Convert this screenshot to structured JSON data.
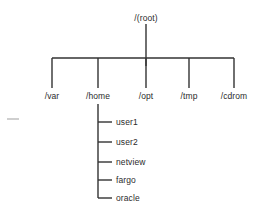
{
  "diagram": {
    "type": "filesystem-tree",
    "title": "/(root)",
    "canvas": {
      "width": 258,
      "height": 211,
      "background": "#ffffff"
    },
    "line_color": "#333333",
    "text_color": "#2b2b2b",
    "root": {
      "label": "/(root)",
      "label_x": 146,
      "label_y": 13,
      "stem_x": 146,
      "stem_top": 24,
      "stem_bottom": 66
    },
    "bus": {
      "y": 58,
      "x_start": 52,
      "x_end": 234
    },
    "children": [
      {
        "label": "/var",
        "x": 52,
        "label_y": 91,
        "branch_top": 58,
        "branch_bottom": 88
      },
      {
        "label": "/home",
        "x": 98,
        "label_y": 91,
        "branch_top": 58,
        "branch_bottom": 88
      },
      {
        "label": "/opt",
        "x": 146,
        "label_y": 91,
        "branch_top": 58,
        "branch_bottom": 88
      },
      {
        "label": "/tmp",
        "x": 189,
        "label_y": 91,
        "branch_top": 58,
        "branch_bottom": 88
      },
      {
        "label": "/cdrom",
        "x": 234,
        "label_y": 91,
        "branch_top": 58,
        "branch_bottom": 88
      }
    ],
    "home_subtree": {
      "parent": "/home",
      "spine_x": 98,
      "spine_top": 104,
      "spine_bottom": 198,
      "stub_end_x": 112,
      "label_x": 116,
      "items": [
        {
          "label": "user1",
          "y": 122
        },
        {
          "label": "user2",
          "y": 142
        },
        {
          "label": "netview",
          "y": 162
        },
        {
          "label": "fargo",
          "y": 180
        },
        {
          "label": "oracle",
          "y": 198
        }
      ]
    },
    "artifacts": [
      {
        "name": "stray-dash-mark",
        "x": 7,
        "y": 118,
        "width": 12,
        "height": 2,
        "color": "#cfcfcf"
      }
    ]
  }
}
